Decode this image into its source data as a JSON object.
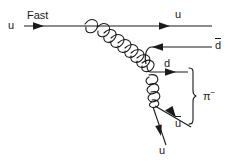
{
  "figure": {
    "background_color": "#ffffff",
    "line_color": "#1a1a1a",
    "width": 235,
    "height": 164
  },
  "labels": {
    "fast": "Fast",
    "u_incoming": "u",
    "u_outgoing": "u",
    "dbar_incoming": "d",
    "d_outgoing": "d",
    "ubar_outgoing": "u",
    "u_bottom": "u",
    "pion": "π",
    "pion_charge": "−"
  },
  "elements": {
    "top_quark_line": "horizontal-u-quark-line",
    "gluon_primary": "gluon-spring-main",
    "gluon_secondary": "gluon-spring-lower",
    "dbar_line": "antiquark-d-line",
    "d_line": "quark-d-line",
    "ubar_line": "antiquark-u-line",
    "u_line": "quark-u-line",
    "brace": "pion-grouping-brace"
  }
}
